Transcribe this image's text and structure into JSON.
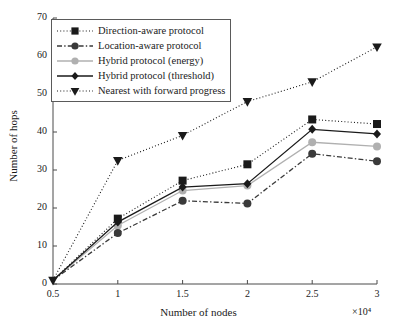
{
  "chart_data": {
    "type": "line",
    "title": "",
    "xlabel": "Number of nodes",
    "ylabel": "Number of hops",
    "x_multiplier": "×10⁴",
    "x": [
      0.5,
      1,
      1.5,
      2,
      2.5,
      3
    ],
    "xlim": [
      0.5,
      3
    ],
    "ylim": [
      0,
      70
    ],
    "xticks": [
      "0.5",
      "1",
      "1.5",
      "2",
      "2.5",
      "3"
    ],
    "yticks": [
      "0",
      "10",
      "20",
      "30",
      "40",
      "50",
      "60",
      "70"
    ],
    "grid": false,
    "legend_position": "upper-left-inside",
    "series": [
      {
        "name": "Direction-aware protocol",
        "marker": "square",
        "linestyle": "dotted",
        "color": "#1a1a1a",
        "values": [
          1,
          17.2,
          27.2,
          31.5,
          43.3,
          42.1
        ]
      },
      {
        "name": "Location-aware protocol",
        "marker": "circle",
        "linestyle": "dashdot",
        "color": "#3a3a3a",
        "values": [
          1,
          13.4,
          21.9,
          21.2,
          34.3,
          32.3
        ]
      },
      {
        "name": "Hybrid protocol (energy)",
        "marker": "circle",
        "linestyle": "solid",
        "color": "#b0b0b0",
        "values": [
          1,
          15.4,
          24.6,
          25.9,
          37.3,
          36.2
        ]
      },
      {
        "name": "Hybrid protocol (threshold)",
        "marker": "diamond",
        "linestyle": "solid",
        "color": "#1a1a1a",
        "values": [
          1,
          16.3,
          25.5,
          26.4,
          40.7,
          39.5
        ]
      },
      {
        "name": "Nearest with forward progress",
        "marker": "triangle-down",
        "linestyle": "dotted",
        "color": "#1a1a1a",
        "values": [
          1,
          32.5,
          39.1,
          48.0,
          53.2,
          62.4
        ]
      }
    ]
  },
  "axes": {
    "x_title": "Number of nodes",
    "y_title": "Number of hops",
    "x_multiplier_label": "×10⁴"
  }
}
